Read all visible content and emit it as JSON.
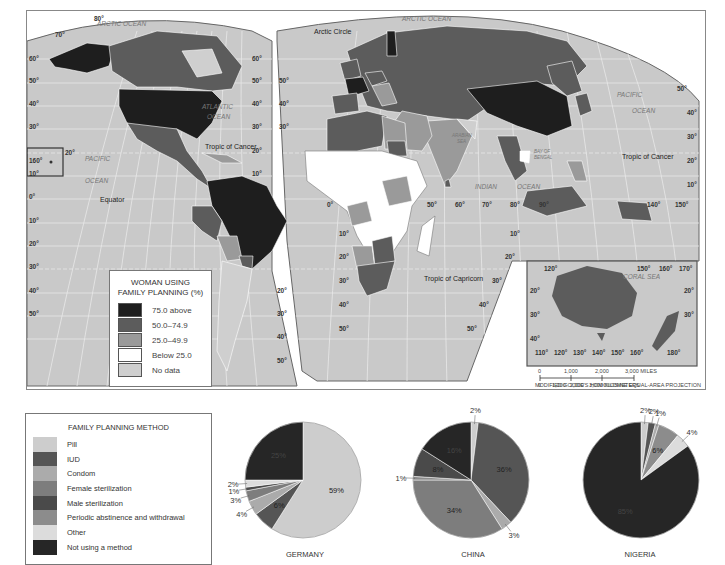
{
  "map": {
    "title_legend": "WOMAN USING FAMILY PLANNING (%)",
    "title_line1": "WOMAN USING",
    "title_line2": "FAMILY PLANNING (%)",
    "legend": [
      {
        "label": "75.0 above",
        "color": "#1e1e1e"
      },
      {
        "label": "50.0–74.9",
        "color": "#5c5c5c"
      },
      {
        "label": "25.0–49.9",
        "color": "#9a9a9a"
      },
      {
        "label": "Below 25.0",
        "color": "#ffffff"
      },
      {
        "label": "No data",
        "color": "#cfcfcf"
      }
    ],
    "labels": {
      "arctic_ocean_west": "ARCTIC OCEAN",
      "arctic_ocean_east": "ARCTIC OCEAN",
      "arctic_circle": "Arctic Circle",
      "atlantic": "ATLANTIC",
      "atlantic_ocean": "OCEAN",
      "tropic_cancer_west": "Tropic of Cancer",
      "tropic_cancer_east": "Tropic of Cancer",
      "pacific_west": "PACIFIC",
      "pacific_west_ocean": "OCEAN",
      "pacific_east": "PACIFIC",
      "pacific_east_ocean": "OCEAN",
      "equator": "Equator",
      "arabian_sea_1": "ARABIAN",
      "arabian_sea_2": "SEA",
      "bay_bengal_1": "BAY OF",
      "bay_bengal_2": "BENGAL",
      "indian": "INDIAN",
      "indian_ocean": "OCEAN",
      "tropic_capricorn": "Tropic of Capricorn",
      "coral_sea": "CORAL SEA"
    },
    "latitudes_west": [
      "80°",
      "70°",
      "60°",
      "50°",
      "40°",
      "30°",
      "20°",
      "10°",
      "0°",
      "10°",
      "20°",
      "30°",
      "40°",
      "50°"
    ],
    "hawaii_lon": "160°",
    "hawaii_lat": "20°",
    "longitudes_mid": [
      "0°",
      "50°",
      "60°",
      "70°",
      "80°",
      "90°"
    ],
    "longitudes_east": [
      "140°",
      "150°"
    ],
    "lat_east": [
      "50°",
      "40°",
      "30°",
      "20°",
      "10°"
    ],
    "australia_inset": {
      "top_lons": [
        "120°",
        "150°",
        "160°",
        "170°"
      ],
      "bottom_lons": [
        "110°",
        "120°",
        "130°",
        "140°",
        "150°",
        "160°",
        "180°"
      ],
      "lats_left": [
        "20°",
        "30°",
        "40°"
      ],
      "lats_right": [
        "20°",
        "30°"
      ]
    },
    "scale": {
      "miles": [
        "0",
        "1,000",
        "2,000",
        "3,000 MILES"
      ],
      "km": [
        "0",
        "1,000",
        "2,000",
        "3,000 KILOMETERS"
      ]
    },
    "projection": "MODIFIED GOODE'S HOMOLOSINE EQUAL-AREA PROJECTION"
  },
  "method_legend": {
    "title": "FAMILY PLANNING METHOD",
    "items": [
      {
        "label": "Pill",
        "color": "#cdcdcd"
      },
      {
        "label": "IUD",
        "color": "#555555"
      },
      {
        "label": "Condom",
        "color": "#ababab"
      },
      {
        "label": "Female sterilization",
        "color": "#7d7d7d"
      },
      {
        "label": "Male sterilization",
        "color": "#4a4a4a"
      },
      {
        "label": "Periodic abstinence and withdrawal",
        "color": "#8c8c8c"
      },
      {
        "label": "Other",
        "color": "#dcdcdc"
      },
      {
        "label": "Not using a method",
        "color": "#262626"
      }
    ]
  },
  "chart_data": [
    {
      "type": "pie",
      "title": "GERMANY",
      "categories": [
        "Pill",
        "IUD",
        "Condom",
        "Female sterilization",
        "Male sterilization",
        "Periodic abstinence and withdrawal",
        "Other",
        "Not using a method"
      ],
      "values": [
        59,
        6,
        4,
        3,
        1,
        0,
        2,
        25
      ],
      "labels": [
        "59%",
        "6%",
        "4%",
        "3%",
        "1%",
        "",
        "2%",
        "25%"
      ]
    },
    {
      "type": "pie",
      "title": "CHINA",
      "categories": [
        "Pill",
        "IUD",
        "Condom",
        "Female sterilization",
        "Male sterilization",
        "Periodic abstinence and withdrawal",
        "Other",
        "Not using a method"
      ],
      "values": [
        2,
        36,
        3,
        34,
        8,
        1,
        0,
        16
      ],
      "labels": [
        "2%",
        "36%",
        "3%",
        "34%",
        "8%",
        "1%",
        "",
        "16%"
      ]
    },
    {
      "type": "pie",
      "title": "NIGERIA",
      "categories": [
        "Pill",
        "IUD",
        "Condom",
        "Female sterilization",
        "Male sterilization",
        "Periodic abstinence and withdrawal",
        "Other",
        "Not using a method"
      ],
      "values": [
        2,
        2,
        1,
        0,
        0,
        6,
        4,
        85
      ],
      "labels": [
        "2%",
        "2%",
        "1%",
        "",
        "",
        "6%",
        "4%",
        "85%"
      ]
    }
  ]
}
